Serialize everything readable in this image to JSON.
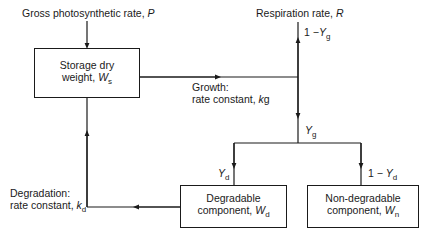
{
  "diagram": {
    "inputs": {
      "photosynthesis": {
        "text": "Gross photosynthetic rate, ",
        "symbol": "P"
      },
      "respiration": {
        "text": "Respiration rate, ",
        "symbol": "R"
      }
    },
    "boxes": {
      "storage": {
        "line1": "Storage dry",
        "line2": "weight, ",
        "symbol": "W",
        "sub": "s"
      },
      "degradable": {
        "line1": "Degradable",
        "line2": "component, ",
        "symbol": "W",
        "sub": "d"
      },
      "non_degradable": {
        "line1": "Non-degradable",
        "line2": "component, ",
        "symbol": "W",
        "sub": "n"
      }
    },
    "edges": {
      "growth": {
        "line1": "Growth:",
        "line2": "rate constant, ",
        "symbol": "k",
        "sub": "g"
      },
      "degradation": {
        "line1": "Degradation:",
        "line2": "rate constant, ",
        "symbol": "k",
        "sub": "d"
      },
      "respiration_fraction": {
        "prefix": "1 −",
        "symbol": "Y",
        "sub": "g"
      },
      "growth_yield": {
        "symbol": "Y",
        "sub": "g"
      },
      "degradable_fraction": {
        "symbol": "Y",
        "sub": "d"
      },
      "non_degradable_fraction": {
        "prefix": "1 − ",
        "symbol": "Y",
        "sub": "d"
      }
    },
    "colors": {
      "line": "#1a1a1a",
      "background": "#ffffff"
    }
  }
}
